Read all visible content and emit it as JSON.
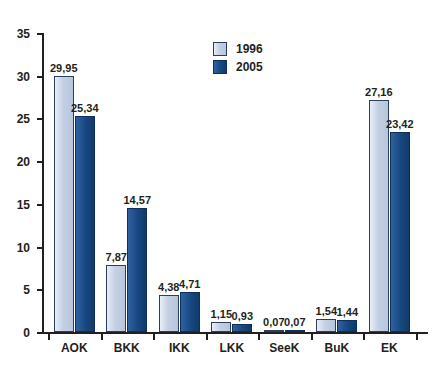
{
  "chart_data": {
    "type": "bar",
    "title": "",
    "subtitle": "",
    "xlabel": "",
    "ylabel": "",
    "categories": [
      "AOK",
      "BKK",
      "IKK",
      "LKK",
      "SeeK",
      "BuK",
      "EK"
    ],
    "series": [
      {
        "name": "1996",
        "color": "#c3cfe3",
        "values": [
          29.95,
          7.87,
          4.38,
          1.15,
          0.07,
          1.54,
          27.16
        ],
        "labels": [
          "29,95",
          "7,87",
          "4,38",
          "1,15",
          "0,07",
          "1,54",
          "27,16"
        ]
      },
      {
        "name": "2005",
        "color": "#17477f",
        "values": [
          25.34,
          14.57,
          4.71,
          0.93,
          0.07,
          1.44,
          23.42
        ],
        "labels": [
          "25,34",
          "14,57",
          "4,71",
          "0,93",
          "0,07",
          "1,44",
          "23,42"
        ]
      }
    ],
    "ylim": [
      0,
      35
    ],
    "yticks": [
      0,
      5,
      10,
      15,
      20,
      25,
      30,
      35
    ],
    "ytick_labels": [
      "0",
      "5",
      "10",
      "15",
      "20",
      "25",
      "30",
      "35"
    ],
    "grid": false,
    "legend_position": "top-center",
    "decimal_separator": ","
  },
  "legend": {
    "entries": [
      {
        "label": "1996"
      },
      {
        "label": "2005"
      }
    ]
  },
  "colors": {
    "series_1996": "#c3cfe3",
    "series_2005": "#17477f",
    "axis": "#231f20",
    "bar_outline": "#2b3e5c",
    "background": "#ffffff"
  }
}
